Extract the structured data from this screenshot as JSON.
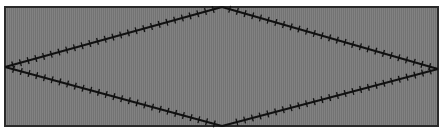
{
  "diagram": {
    "panel": {
      "fill_color": "#7a7a7a",
      "border_color": "#2a2a2a"
    },
    "line_color": "#111111",
    "tick_spacing": 8,
    "tick_length": 7,
    "vertices": {
      "top": [
        222,
        7
      ],
      "right": [
        438,
        69
      ],
      "bottom": [
        222,
        126
      ],
      "left": [
        5,
        67
      ]
    },
    "edges": [
      {
        "name": "top-left-edge",
        "from": "left",
        "to": "top"
      },
      {
        "name": "top-right-edge",
        "from": "top",
        "to": "right"
      },
      {
        "name": "bottom-right-edge",
        "from": "right",
        "to": "bottom"
      },
      {
        "name": "bottom-left-edge",
        "from": "bottom",
        "to": "left"
      }
    ]
  }
}
